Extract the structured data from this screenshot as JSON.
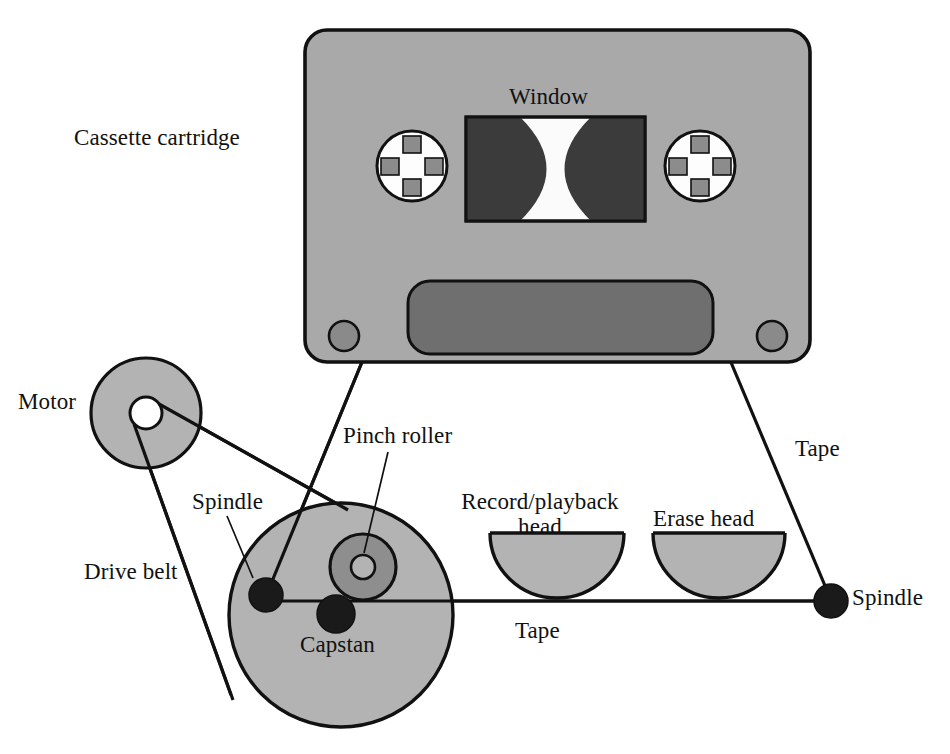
{
  "diagram": {
    "background": "#ffffff",
    "line_color": "#111111",
    "colors": {
      "cassette_body": "#a9a9a9",
      "cassette_label_panel": "#6f6f6f",
      "window_white": "#fbfbfb",
      "tape_pack_dark": "#3b3b3b",
      "hub_white": "#fdfdfd",
      "hub_square": "#8c8c8c",
      "corner_hole": "#8a8a8a",
      "flywheel": "#b3b3b3",
      "motor_pulley": "#b3b3b3",
      "pinch_roller": "#8e8e8e",
      "head_fill": "#b3b3b3",
      "spindle_black": "#1a1a1a",
      "capstan_black": "#1a1a1a"
    },
    "labels": [
      {
        "name": "cassette-cartridge",
        "text": "Cassette cartridge",
        "x": 74,
        "y": 126,
        "align": "left"
      },
      {
        "name": "window",
        "text": "Window",
        "x": 509,
        "y": 85,
        "align": "left"
      },
      {
        "name": "motor",
        "text": "Motor",
        "x": 18,
        "y": 390,
        "align": "left"
      },
      {
        "name": "pinch-roller",
        "text": "Pinch roller",
        "x": 343,
        "y": 424,
        "align": "left"
      },
      {
        "name": "spindle-left",
        "text": "Spindle",
        "x": 192,
        "y": 490,
        "align": "left"
      },
      {
        "name": "drive-belt",
        "text": "Drive belt",
        "x": 84,
        "y": 560,
        "align": "left"
      },
      {
        "name": "record-playback-head",
        "text": "Record/playback\nhead",
        "x": 451,
        "y": 490,
        "align": "center",
        "width": 178
      },
      {
        "name": "erase-head",
        "text": "Erase head",
        "x": 653,
        "y": 507,
        "align": "left"
      },
      {
        "name": "tape-right-upper",
        "text": "Tape",
        "x": 795,
        "y": 437,
        "align": "left"
      },
      {
        "name": "spindle-right",
        "text": "Spindle",
        "x": 852,
        "y": 586,
        "align": "left"
      },
      {
        "name": "capstan",
        "text": "Capstan",
        "x": 300,
        "y": 633,
        "align": "left"
      },
      {
        "name": "tape-bottom",
        "text": "Tape",
        "x": 515,
        "y": 619,
        "align": "left"
      }
    ],
    "parts": {
      "cassette_body": {
        "x": 305,
        "y": 30,
        "width": 505,
        "height": 332,
        "radius": 22
      },
      "window": {
        "x": 466,
        "y": 117,
        "width": 179,
        "height": 104
      },
      "hub_left": {
        "cx": 412,
        "cy": 166,
        "r": 35
      },
      "hub_right": {
        "cx": 700,
        "cy": 166,
        "r": 35
      },
      "label_panel": {
        "x": 408,
        "y": 281,
        "width": 305,
        "height": 72,
        "radius": 22
      },
      "corner_hole_left": {
        "cx": 344,
        "cy": 336,
        "r": 15
      },
      "corner_hole_right": {
        "cx": 772,
        "cy": 336,
        "r": 15
      },
      "motor_pulley": {
        "cx": 146,
        "cy": 413,
        "r": 55,
        "hub_r": 16
      },
      "flywheel": {
        "cx": 341,
        "cy": 615,
        "r": 112
      },
      "pinch_roller": {
        "cx": 363,
        "cy": 567,
        "r_outer": 33,
        "r_inner": 12
      },
      "capstan": {
        "cx": 336,
        "cy": 614,
        "r": 19
      },
      "spindle_left": {
        "cx": 266,
        "cy": 595,
        "r": 17
      },
      "spindle_right": {
        "cx": 831,
        "cy": 601,
        "r": 17
      },
      "head_record": {
        "cx": 557,
        "cy": 533,
        "rx": 67,
        "ry": 65
      },
      "head_erase": {
        "cx": 719,
        "cy": 533,
        "rx": 66,
        "ry": 65
      },
      "tape_line_y": 601,
      "tape_exit_left": {
        "x": 362,
        "y": 362
      },
      "tape_exit_right": {
        "x": 730,
        "y": 360
      }
    }
  }
}
